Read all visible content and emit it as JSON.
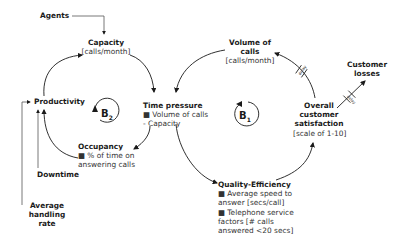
{
  "diagram": {
    "type": "causal-loop-diagram",
    "nodes": {
      "agents": {
        "title": "Agents"
      },
      "capacity": {
        "title": "Capacity",
        "unit": "[calls/month]"
      },
      "productivity": {
        "title": "Productivity"
      },
      "time_pressure": {
        "title": "Time pressure",
        "bullets": [
          "■ Volume of calls",
          "- Capacity"
        ]
      },
      "occupancy": {
        "title": "Occupancy",
        "bullets": [
          "■ % of time on",
          "answering calls"
        ]
      },
      "downtime": {
        "title": "Downtime"
      },
      "average_handling_rate": {
        "title": "Average handling rate",
        "lines": [
          "Average",
          "handling",
          "rate"
        ]
      },
      "volume_of_calls": {
        "title": "Volume of calls",
        "lines": [
          "Volume of",
          "calls"
        ],
        "unit": "[calls/month]"
      },
      "overall_customer_satisfaction": {
        "lines": [
          "Overall",
          "customer",
          "satisfaction"
        ],
        "unit": "[scale of 1-10]"
      },
      "customer_losses": {
        "lines": [
          "Customer",
          "losses"
        ]
      },
      "quality_efficiency": {
        "title": "Quality-Efficiency",
        "bullets": [
          "■ Average speed to",
          "answer [secs/call]",
          "■ Telephone service",
          "factors [# calls",
          "answered <20 secs]"
        ]
      }
    },
    "loops": {
      "b2": {
        "letter": "B",
        "index": "2"
      },
      "b1": {
        "letter": "B",
        "index": "1"
      }
    },
    "delay_label": "delay",
    "edges": [
      {
        "from": "Agents",
        "to": "Capacity"
      },
      {
        "from": "Capacity",
        "to": "Time pressure"
      },
      {
        "from": "Time pressure",
        "to": "Occupancy"
      },
      {
        "from": "Occupancy",
        "to": "Productivity"
      },
      {
        "from": "Productivity",
        "to": "Capacity"
      },
      {
        "from": "Downtime",
        "to": "Productivity"
      },
      {
        "from": "Average handling rate",
        "to": "Productivity"
      },
      {
        "from": "Time pressure",
        "to": "Quality-Efficiency"
      },
      {
        "from": "Quality-Efficiency",
        "to": "Overall customer satisfaction"
      },
      {
        "from": "Overall customer satisfaction",
        "to": "Volume of calls",
        "delay": true
      },
      {
        "from": "Volume of calls",
        "to": "Time pressure"
      },
      {
        "from": "Overall customer satisfaction",
        "to": "Customer losses",
        "delay": true
      }
    ]
  }
}
